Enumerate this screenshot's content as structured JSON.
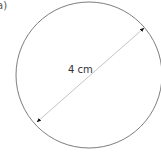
{
  "figure": {
    "part_label": "a)",
    "shape": "circle",
    "dimension_label": "4 cm",
    "dimension_type": "diameter"
  },
  "colors": {
    "circle_stroke": "#6e6e6e",
    "diameter_line": "#bdbdbd",
    "arrowhead": "#111111",
    "text": "#333333"
  }
}
